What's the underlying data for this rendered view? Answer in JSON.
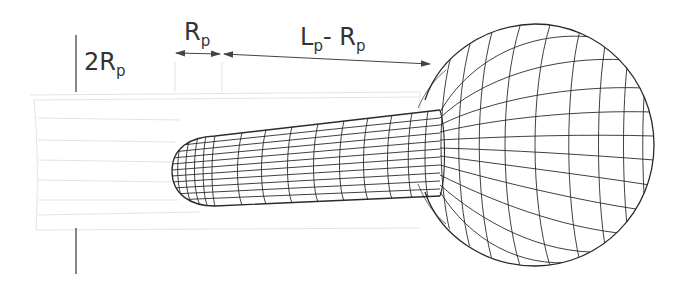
{
  "figure": {
    "type": "schematic",
    "colors": {
      "background": "#ffffff",
      "mesh": "#2a2a2a",
      "channel": "#d6d6d6",
      "annotation": "#444444"
    }
  },
  "labels": {
    "diameter": {
      "main": "2R",
      "sub": "p"
    },
    "cap_length": {
      "main": "R",
      "sub": "p"
    },
    "body_length": {
      "main1": "L",
      "sub1": "p",
      "sep": "- ",
      "main2": "R",
      "sub2": "p"
    }
  },
  "dimensions": [
    {
      "name": "2Rp",
      "orientation": "vertical"
    },
    {
      "name": "Rp",
      "orientation": "horizontal"
    },
    {
      "name": "Lp - Rp",
      "orientation": "horizontal"
    }
  ]
}
